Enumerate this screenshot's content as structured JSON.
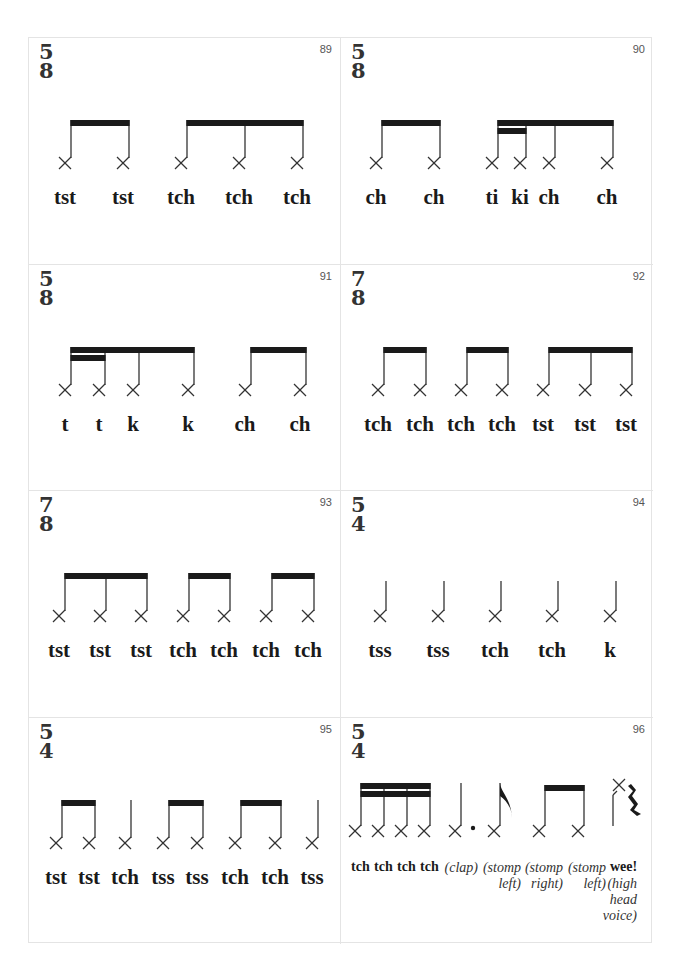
{
  "page": {
    "border_color": "#e4e4e4",
    "ink_color": "#1a1a1a"
  },
  "cells": [
    {
      "number": "89",
      "time_top": "5",
      "time_bottom": "8",
      "notes": [
        36,
        94,
        152,
        210,
        268
      ],
      "beams": [
        [
          0,
          1,
          0
        ],
        [
          2,
          4,
          0
        ]
      ],
      "syllables": [
        {
          "text": "tst",
          "x": 36
        },
        {
          "text": "tst",
          "x": 94
        },
        {
          "text": "tch",
          "x": 152
        },
        {
          "text": "tch",
          "x": 210
        },
        {
          "text": "tch",
          "x": 268
        }
      ]
    },
    {
      "number": "90",
      "time_top": "5",
      "time_bottom": "8",
      "notes": [
        35,
        93,
        151,
        179,
        208,
        266
      ],
      "beams": [
        [
          0,
          1,
          0
        ],
        [
          2,
          5,
          0
        ],
        [
          2,
          3,
          1
        ]
      ],
      "syllables": [
        {
          "text": "ch",
          "x": 35
        },
        {
          "text": "ch",
          "x": 93
        },
        {
          "text": "ti",
          "x": 151
        },
        {
          "text": "ki",
          "x": 179
        },
        {
          "text": "ch",
          "x": 208
        },
        {
          "text": "ch",
          "x": 266
        }
      ]
    },
    {
      "number": "91",
      "time_top": "5",
      "time_bottom": "8",
      "notes": [
        36,
        70,
        104,
        159,
        216,
        271
      ],
      "beams": [
        [
          0,
          3,
          0
        ],
        [
          0,
          1,
          1
        ],
        [
          4,
          5,
          0
        ]
      ],
      "syllables": [
        {
          "text": "t",
          "x": 36
        },
        {
          "text": "t",
          "x": 70
        },
        {
          "text": "k",
          "x": 104
        },
        {
          "text": "k",
          "x": 159
        },
        {
          "text": "ch",
          "x": 216
        },
        {
          "text": "ch",
          "x": 271
        }
      ]
    },
    {
      "number": "92",
      "time_top": "7",
      "time_bottom": "8",
      "notes": [
        37,
        79,
        120,
        161,
        202,
        244,
        285
      ],
      "beams": [
        [
          0,
          1,
          0
        ],
        [
          2,
          3,
          0
        ],
        [
          4,
          6,
          0
        ]
      ],
      "syllables": [
        {
          "text": "tch",
          "x": 37
        },
        {
          "text": "tch",
          "x": 79
        },
        {
          "text": "tch",
          "x": 120
        },
        {
          "text": "tch",
          "x": 161
        },
        {
          "text": "tst",
          "x": 202
        },
        {
          "text": "tst",
          "x": 244
        },
        {
          "text": "tst",
          "x": 285
        }
      ]
    },
    {
      "number": "93",
      "time_top": "7",
      "time_bottom": "8",
      "notes": [
        30,
        71,
        112,
        154,
        195,
        237,
        279
      ],
      "beams": [
        [
          0,
          2,
          0
        ],
        [
          3,
          4,
          0
        ],
        [
          5,
          6,
          0
        ]
      ],
      "syllables": [
        {
          "text": "tst",
          "x": 30
        },
        {
          "text": "tst",
          "x": 71
        },
        {
          "text": "tst",
          "x": 112
        },
        {
          "text": "tch",
          "x": 154
        },
        {
          "text": "tch",
          "x": 195
        },
        {
          "text": "tch",
          "x": 237
        },
        {
          "text": "tch",
          "x": 279
        }
      ]
    },
    {
      "number": "94",
      "time_top": "5",
      "time_bottom": "4",
      "notes": [
        39,
        97,
        154,
        211,
        269
      ],
      "beams": [],
      "syllables": [
        {
          "text": "tss",
          "x": 39
        },
        {
          "text": "tss",
          "x": 97
        },
        {
          "text": "tch",
          "x": 154
        },
        {
          "text": "tch",
          "x": 211
        },
        {
          "text": "k",
          "x": 269
        }
      ]
    },
    {
      "number": "95",
      "time_top": "5",
      "time_bottom": "4",
      "notes": [
        27,
        60,
        96,
        134,
        168,
        206,
        246,
        283
      ],
      "beams": [
        [
          0,
          1,
          0
        ],
        [
          3,
          4,
          0
        ],
        [
          5,
          6,
          0
        ]
      ],
      "syllables": [
        {
          "text": "tst",
          "x": 27
        },
        {
          "text": "tst",
          "x": 60
        },
        {
          "text": "tch",
          "x": 96
        },
        {
          "text": "tss",
          "x": 134
        },
        {
          "text": "tss",
          "x": 168
        },
        {
          "text": "tch",
          "x": 206
        },
        {
          "text": "tch",
          "x": 246
        },
        {
          "text": "tss",
          "x": 283
        }
      ]
    },
    {
      "number": "96",
      "time_top": "5",
      "time_bottom": "4",
      "special": true,
      "syllables_bold": [
        "tch",
        "tch",
        "tch",
        "tch"
      ],
      "syllables_italic": [
        "(clap)",
        "(stomp\nleft)",
        "(stomp\nright)",
        "(stomp\nleft)"
      ],
      "final_bold": "wee!",
      "final_italic": "(high\nhead\nvoice)"
    }
  ]
}
